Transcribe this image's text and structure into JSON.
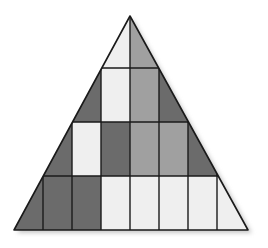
{
  "diagram": {
    "title": "",
    "palette": {
      "dark": "#6b6b6b",
      "mid": "#a0a0a0",
      "light": "#efefef",
      "stroke": "#1a1a1a",
      "shadow": "#c8c8c8"
    },
    "geometry": {
      "apex": [
        130,
        16
      ],
      "base_left": [
        14,
        230
      ],
      "base_right": [
        248,
        230
      ],
      "row_boundaries_y": [
        16,
        68,
        122,
        176,
        230
      ],
      "column_lines_x": [
        43,
        72,
        101,
        130,
        159,
        188,
        217
      ]
    },
    "rows": [
      {
        "row": 1,
        "cells": [
          "light",
          "mid"
        ]
      },
      {
        "row": 2,
        "cells": [
          "dark",
          "light",
          "mid",
          "dark"
        ]
      },
      {
        "row": 3,
        "cells": [
          "dark",
          "light",
          "dark",
          "mid",
          "mid",
          "dark"
        ]
      },
      {
        "row": 4,
        "cells": [
          "dark",
          "dark",
          "dark",
          "light",
          "light",
          "light",
          "light",
          "light"
        ]
      }
    ]
  }
}
